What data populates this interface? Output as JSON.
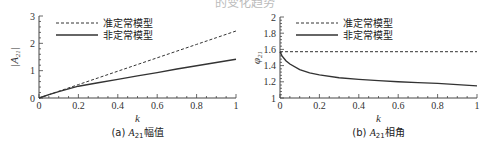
{
  "header": {
    "partial_title": "的变化趋势"
  },
  "chart_data": [
    {
      "type": "line",
      "title": "",
      "caption": "(a) A21幅值",
      "caption_prefix": "(a) ",
      "caption_symbol": "A",
      "caption_sub": "21",
      "caption_suffix": "幅值",
      "xlabel": "k",
      "ylabel": "|A21|",
      "xlim": [
        0,
        1
      ],
      "ylim": [
        0,
        3
      ],
      "xticks": [
        0,
        0.2,
        0.4,
        0.6,
        0.8,
        1
      ],
      "xtick_labels": [
        "0",
        "0.2",
        "0.4",
        "0.6",
        "0.8",
        "1"
      ],
      "yticks": [
        0,
        1,
        2,
        3
      ],
      "ytick_labels": [
        "0",
        "1",
        "2",
        "3"
      ],
      "grid": false,
      "legend_position": "upper left",
      "x": [
        0,
        0.05,
        0.1,
        0.2,
        0.3,
        0.4,
        0.5,
        0.6,
        0.7,
        0.8,
        0.9,
        1.0
      ],
      "series": [
        {
          "name": "准定常模型",
          "style": "dashed",
          "values": [
            0,
            0.12,
            0.245,
            0.49,
            0.735,
            0.98,
            1.225,
            1.47,
            1.715,
            1.96,
            2.205,
            2.45
          ]
        },
        {
          "name": "非定常模型",
          "style": "solid",
          "values": [
            0,
            0.12,
            0.23,
            0.43,
            0.56,
            0.68,
            0.81,
            0.93,
            1.06,
            1.18,
            1.3,
            1.42
          ]
        }
      ]
    },
    {
      "type": "line",
      "title": "",
      "caption": "(b) A21相角",
      "caption_prefix": "(b) ",
      "caption_symbol": "A",
      "caption_sub": "21",
      "caption_suffix": "相角",
      "xlabel": "k",
      "ylabel": "φ21",
      "xlim": [
        0,
        1
      ],
      "ylim": [
        1,
        2
      ],
      "xticks": [
        0,
        0.2,
        0.4,
        0.6,
        0.8,
        1
      ],
      "xtick_labels": [
        "0",
        "0.2",
        "0.4",
        "0.6",
        "0.8",
        "1"
      ],
      "yticks": [
        1,
        1.2,
        1.4,
        1.6,
        1.8,
        2
      ],
      "ytick_labels": [
        "1",
        "1.2",
        "1.4",
        "1.6",
        "1.8",
        "2"
      ],
      "grid": false,
      "legend_position": "upper left",
      "x": [
        0,
        0.01,
        0.03,
        0.05,
        0.1,
        0.15,
        0.2,
        0.3,
        0.4,
        0.5,
        0.6,
        0.7,
        0.8,
        0.9,
        1.0
      ],
      "series": [
        {
          "name": "准定常模型",
          "style": "dashed",
          "values": [
            1.571,
            1.571,
            1.571,
            1.571,
            1.571,
            1.571,
            1.571,
            1.571,
            1.571,
            1.571,
            1.571,
            1.571,
            1.571,
            1.571,
            1.571
          ]
        },
        {
          "name": "非定常模型",
          "style": "solid",
          "values": [
            1.571,
            1.52,
            1.46,
            1.42,
            1.35,
            1.31,
            1.285,
            1.25,
            1.23,
            1.215,
            1.2,
            1.19,
            1.18,
            1.165,
            1.15
          ]
        }
      ]
    }
  ]
}
